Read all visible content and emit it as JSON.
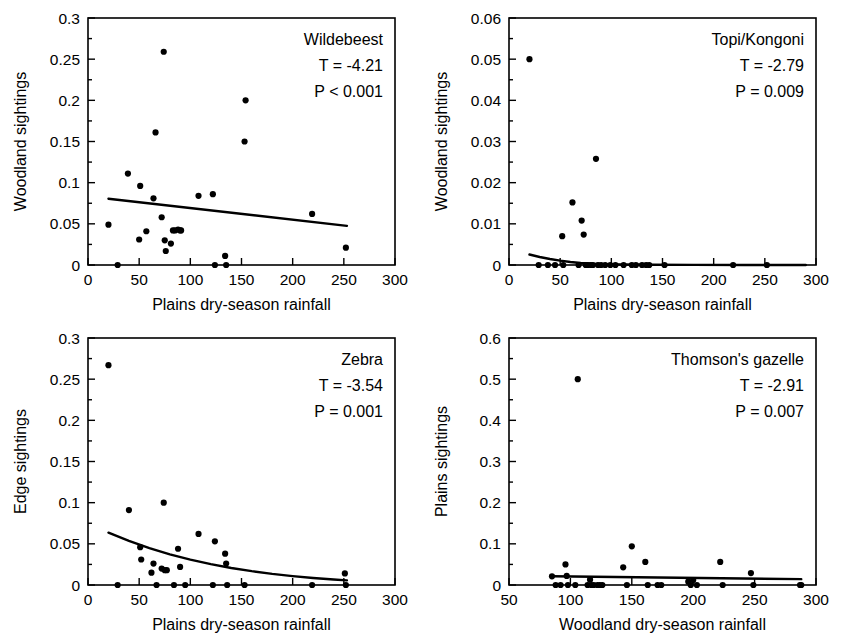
{
  "figure": {
    "panel_count": 4,
    "marker_color": "#000000",
    "line_color": "#000000",
    "background": "#ffffff"
  },
  "chart_data": [
    {
      "type": "scatter",
      "panel": "top-left",
      "title": "Wildebeest",
      "annotations": [
        "Wildebeest",
        "T = -4.21",
        "P < 0.001"
      ],
      "stat_T": "T = -4.21",
      "stat_P": "P < 0.001",
      "xlabel": "Plains dry-season rainfall",
      "ylabel": "Woodland sightings",
      "xlim": [
        0,
        300
      ],
      "ylim": [
        0,
        0.3
      ],
      "xticks": [
        0,
        50,
        100,
        150,
        200,
        250,
        300
      ],
      "xtick_labels": [
        "0",
        "50",
        "100",
        "150",
        "200",
        "250",
        "300"
      ],
      "yticks": [
        0,
        0.05,
        0.1,
        0.15,
        0.2,
        0.25,
        0.3
      ],
      "ytick_labels": [
        "0",
        "0.05",
        "0.1",
        "0.15",
        "0.2",
        "0.25",
        "0.3"
      ],
      "grid": false,
      "legend": "none",
      "fit_type": "linear",
      "fit_points": [
        [
          20,
          0.0805
        ],
        [
          253,
          0.0475
        ]
      ],
      "x": [
        20,
        29,
        39,
        50,
        51,
        57,
        64,
        66,
        72,
        74,
        75,
        76,
        81,
        83,
        85,
        88,
        90,
        91,
        108,
        122,
        124,
        134,
        135,
        153,
        154,
        219,
        252
      ],
      "y": [
        0.049,
        0.0,
        0.111,
        0.031,
        0.096,
        0.041,
        0.081,
        0.161,
        0.058,
        0.259,
        0.03,
        0.017,
        0.026,
        0.042,
        0.042,
        0.043,
        0.042,
        0.042,
        0.084,
        0.086,
        0.0,
        0.011,
        0.0,
        0.15,
        0.2,
        0.062,
        0.021
      ]
    },
    {
      "type": "scatter",
      "panel": "top-right",
      "title": "Topi/Kongoni",
      "annotations": [
        "Topi/Kongoni",
        "T = -2.79",
        "P = 0.009"
      ],
      "stat_T": "T = -2.79",
      "stat_P": "P = 0.009",
      "xlabel": "Plains dry-season rainfall",
      "ylabel": "Woodland sightings",
      "xlim": [
        0,
        300
      ],
      "ylim": [
        0,
        0.06
      ],
      "xticks": [
        0,
        50,
        100,
        150,
        200,
        250,
        300
      ],
      "xtick_labels": [
        "0",
        "50",
        "100",
        "150",
        "200",
        "250",
        "300"
      ],
      "yticks": [
        0,
        0.01,
        0.02,
        0.03,
        0.04,
        0.05,
        0.06
      ],
      "ytick_labels": [
        "0",
        "0.01",
        "0.02",
        "0.03",
        "0.04",
        "0.05",
        "0.06"
      ],
      "grid": false,
      "legend": "none",
      "fit_type": "curve-decay",
      "fit_points": [
        [
          20,
          0.00255
        ],
        [
          30,
          0.00195
        ],
        [
          40,
          0.00145
        ],
        [
          50,
          0.00105
        ],
        [
          60,
          0.00072
        ],
        [
          70,
          0.00048
        ],
        [
          80,
          0.00032
        ],
        [
          90,
          0.00022
        ],
        [
          110,
          0.00012
        ],
        [
          140,
          6e-05
        ],
        [
          180,
          3e-05
        ],
        [
          230,
          1e-05
        ],
        [
          290,
          0.0
        ]
      ],
      "x": [
        20,
        29,
        38,
        45,
        52,
        53,
        62,
        68,
        71,
        73,
        75,
        77,
        80,
        82,
        85,
        87,
        90,
        94,
        99,
        104,
        112,
        120,
        124,
        130,
        134,
        137,
        152,
        219,
        252
      ],
      "y": [
        0.05,
        0.0,
        0.0,
        0.0,
        0.007,
        0.0,
        0.0152,
        0.0,
        0.0108,
        0.0074,
        0.0,
        0.0,
        0.0,
        0.0,
        0.0258,
        0.0,
        0.0,
        0.0,
        0.0,
        0.0,
        0.0,
        0.0,
        0.0,
        0.0,
        0.0,
        0.0,
        0.0,
        0.0,
        0.0
      ]
    },
    {
      "type": "scatter",
      "panel": "bottom-left",
      "title": "Zebra",
      "annotations": [
        "Zebra",
        "T = -3.54",
        "P = 0.001"
      ],
      "stat_T": "T = -3.54",
      "stat_P": "P = 0.001",
      "xlabel": "Plains dry-season rainfall",
      "ylabel": "Edge sightings",
      "xlim": [
        0,
        300
      ],
      "ylim": [
        0,
        0.3
      ],
      "xticks": [
        0,
        50,
        100,
        150,
        200,
        250,
        300
      ],
      "xtick_labels": [
        "0",
        "50",
        "100",
        "150",
        "200",
        "250",
        "300"
      ],
      "yticks": [
        0,
        0.05,
        0.1,
        0.15,
        0.2,
        0.25,
        0.3
      ],
      "ytick_labels": [
        "0",
        "0.05",
        "0.1",
        "0.15",
        "0.2",
        "0.25",
        "0.3"
      ],
      "grid": false,
      "legend": "none",
      "fit_type": "curve-decay",
      "fit_points": [
        [
          20,
          0.0635
        ],
        [
          40,
          0.0535
        ],
        [
          60,
          0.0448
        ],
        [
          80,
          0.0372
        ],
        [
          100,
          0.0308
        ],
        [
          120,
          0.0253
        ],
        [
          140,
          0.0207
        ],
        [
          160,
          0.0168
        ],
        [
          180,
          0.0135
        ],
        [
          200,
          0.0108
        ],
        [
          220,
          0.0085
        ],
        [
          240,
          0.0066
        ],
        [
          253,
          0.0056
        ]
      ],
      "x": [
        20,
        29,
        40,
        51,
        52,
        62,
        64,
        67,
        72,
        74,
        75,
        77,
        84,
        88,
        90,
        95,
        108,
        122,
        124,
        134,
        135,
        136,
        153,
        219,
        251,
        252
      ],
      "y": [
        0.267,
        0.0,
        0.091,
        0.046,
        0.031,
        0.015,
        0.026,
        0.0,
        0.02,
        0.1,
        0.018,
        0.018,
        0.0,
        0.044,
        0.022,
        0.0,
        0.062,
        0.0,
        0.053,
        0.038,
        0.026,
        0.0,
        0.0,
        0.0,
        0.014,
        0.0
      ]
    },
    {
      "type": "scatter",
      "panel": "bottom-right",
      "title": "Thomson's gazelle",
      "annotations": [
        "Thomson's gazelle",
        "T = -2.91",
        "P = 0.007"
      ],
      "stat_T": "T = -2.91",
      "stat_P": "P = 0.007",
      "xlabel": "Woodland dry-season rainfall",
      "ylabel": "Plains sightings",
      "xlim": [
        50,
        300
      ],
      "ylim": [
        0,
        0.6
      ],
      "xticks": [
        50,
        100,
        150,
        200,
        250,
        300
      ],
      "xtick_labels": [
        "50",
        "100",
        "150",
        "200",
        "250",
        "300"
      ],
      "yticks": [
        0,
        0.1,
        0.2,
        0.3,
        0.4,
        0.5,
        0.6
      ],
      "ytick_labels": [
        "0",
        "0.1",
        "0.2",
        "0.3",
        "0.4",
        "0.5",
        "0.6"
      ],
      "grid": false,
      "legend": "none",
      "fit_type": "linear",
      "fit_points": [
        [
          85,
          0.0212
        ],
        [
          288,
          0.0142
        ]
      ],
      "x": [
        85,
        88,
        92,
        96,
        97,
        98,
        104,
        106,
        114,
        116,
        117,
        119,
        122,
        124,
        126,
        143,
        146,
        150,
        161,
        163,
        171,
        174,
        196,
        198,
        200,
        203,
        222,
        224,
        247,
        249,
        287,
        288
      ],
      "y": [
        0.021,
        0.0,
        0.0,
        0.05,
        0.022,
        0.0,
        0.0,
        0.5,
        0.0,
        0.013,
        0.0,
        0.0,
        0.0,
        0.0,
        0.0,
        0.043,
        0.0,
        0.094,
        0.056,
        0.0,
        0.0,
        0.0,
        0.008,
        0.0,
        0.012,
        0.0,
        0.056,
        0.0,
        0.029,
        0.0,
        0.0,
        0.0
      ]
    }
  ]
}
